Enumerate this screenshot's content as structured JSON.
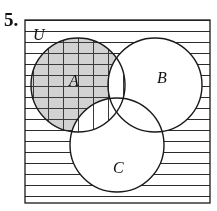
{
  "figure": {
    "problem_number": "5.",
    "universe_label": "U",
    "set_labels": {
      "a": "A",
      "b": "B",
      "c": "C"
    },
    "colors": {
      "ink": "#1a1a1a",
      "shade_fill": "#d2d2d2",
      "hatch_line": "#3a3a3a",
      "background": "#ffffff",
      "rule_line": "#2b2b2b"
    },
    "geometry": {
      "rect": {
        "x": 25,
        "y": 20,
        "width": 185,
        "height": 183
      },
      "circle_a": {
        "cx": 78,
        "cy": 85,
        "r": 47
      },
      "circle_b": {
        "cx": 155,
        "cy": 85,
        "r": 47
      },
      "circle_c": {
        "cx": 117,
        "cy": 145,
        "r": 47
      }
    },
    "label_positions": {
      "problem_number": {
        "x": 4,
        "y": 26
      },
      "universe": {
        "x": 33,
        "y": 38
      },
      "a": {
        "x": 70,
        "y": 85
      },
      "b": {
        "x": 158,
        "y": 82
      },
      "c": {
        "x": 114,
        "y": 172
      }
    },
    "hatching": {
      "horizontal_spacing": 11,
      "vertical_spacing": 15,
      "regions": {
        "outside_circles": "horizontal-rules",
        "set_a_only": "cross-hatch-on-gray",
        "a_intersect_b": "vertical-rules",
        "a_intersect_c": "vertical-rules",
        "a_intersect_b_intersect_c": "vertical-rules",
        "set_b_only": "none",
        "set_c_only": "none",
        "b_intersect_c": "none"
      }
    }
  }
}
